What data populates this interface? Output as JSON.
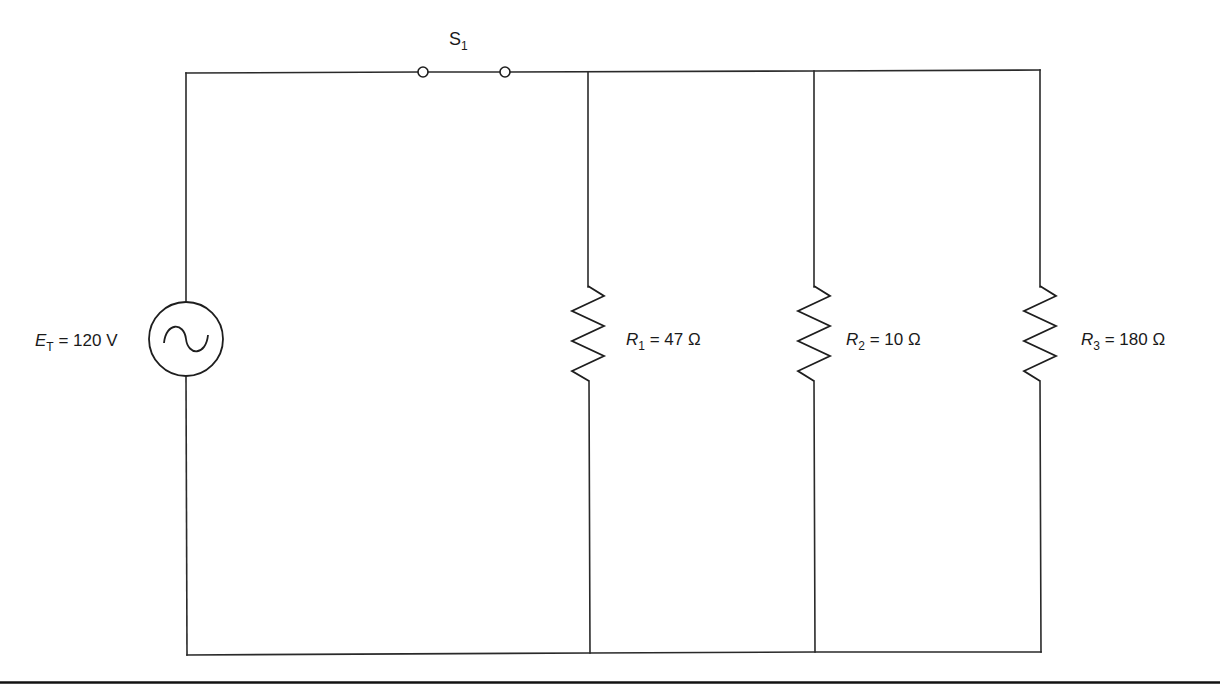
{
  "diagram": {
    "type": "parallel-circuit-schematic",
    "colors": {
      "background": "#ffffff",
      "line": "#1e1e1e"
    },
    "source": {
      "kind": "AC voltage source",
      "symbol": "E",
      "subscript": "T",
      "equals": " = ",
      "value": "120 V"
    },
    "switch": {
      "symbol": "S",
      "subscript": "1",
      "state": "closed"
    },
    "resistors": [
      {
        "symbol": "R",
        "subscript": "1",
        "equals": " = ",
        "value": "47 Ω"
      },
      {
        "symbol": "R",
        "subscript": "2",
        "equals": " = ",
        "value": "10 Ω"
      },
      {
        "symbol": "R",
        "subscript": "3",
        "equals": " = ",
        "value": "180 Ω"
      }
    ]
  }
}
